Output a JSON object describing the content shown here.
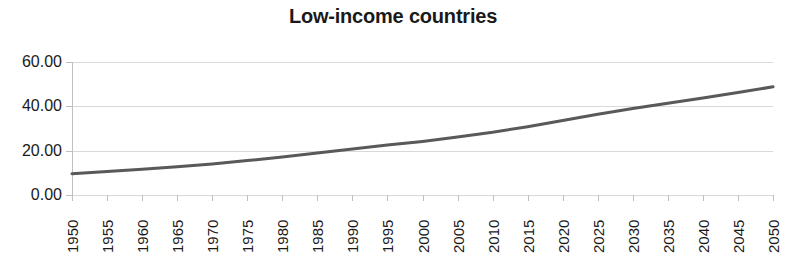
{
  "chart_data": {
    "type": "line",
    "title": "Low-income countries",
    "xlabel": "",
    "ylabel": "",
    "x": [
      1950,
      1955,
      1960,
      1965,
      1970,
      1975,
      1980,
      1985,
      1990,
      1995,
      2000,
      2005,
      2010,
      2015,
      2020,
      2025,
      2030,
      2035,
      2040,
      2045,
      2050
    ],
    "values": [
      9.6,
      10.6,
      11.6,
      12.7,
      14.0,
      15.5,
      17.2,
      19.0,
      20.8,
      22.5,
      24.2,
      26.1,
      28.3,
      30.8,
      33.6,
      36.4,
      39.0,
      41.4,
      43.7,
      46.2,
      48.8
    ],
    "series": [
      {
        "name": "Low-income countries",
        "values": [
          9.6,
          10.6,
          11.6,
          12.7,
          14.0,
          15.5,
          17.2,
          19.0,
          20.8,
          22.5,
          24.2,
          26.1,
          28.3,
          30.8,
          33.6,
          36.4,
          39.0,
          41.4,
          43.7,
          46.2,
          48.8
        ],
        "color": "#595959"
      }
    ],
    "x_tick_labels": [
      "1950",
      "1955",
      "1960",
      "1965",
      "1970",
      "1975",
      "1980",
      "1985",
      "1990",
      "1995",
      "2000",
      "2005",
      "2010",
      "2015",
      "2020",
      "2025",
      "2030",
      "2035",
      "2040",
      "2045",
      "2050"
    ],
    "y_tick_labels": [
      "60.00",
      "40.00",
      "20.00",
      "0.00"
    ],
    "y_tick_values": [
      60,
      40,
      20,
      0
    ],
    "ylim": [
      0,
      60
    ],
    "xlim": [
      1950,
      2050
    ],
    "grid": true,
    "legend": false,
    "gridline_color": "#d9d9d9",
    "axis_color": "#bfbfbf",
    "text_color": "#1a1a1a",
    "line_color": "#595959",
    "line_width": 3,
    "x_tick_rotation": -90
  }
}
